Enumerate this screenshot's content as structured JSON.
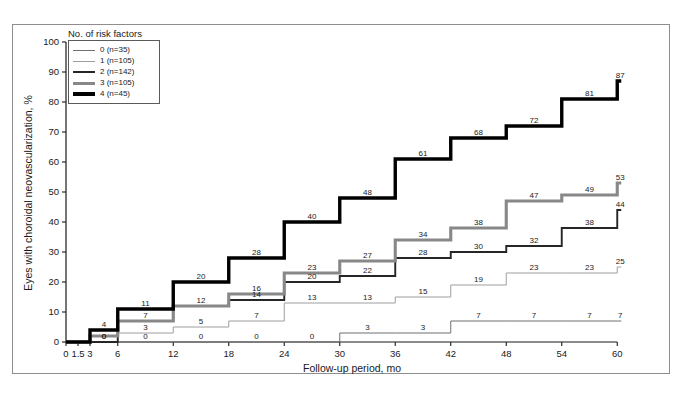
{
  "chart_data": {
    "type": "line",
    "subtype": "step",
    "title": "",
    "xlabel": "Follow-up period, mo",
    "ylabel": "Eyes with choroidal neovascularization, %",
    "xlim": [
      0,
      60
    ],
    "ylim": [
      0,
      100
    ],
    "xticks": [
      "0",
      "1.5",
      "3",
      "6",
      "12",
      "18",
      "24",
      "30",
      "36",
      "42",
      "48",
      "54",
      "60"
    ],
    "xtick_values": [
      0,
      1.5,
      3,
      6,
      12,
      18,
      24,
      30,
      36,
      42,
      48,
      54,
      60
    ],
    "yticks": [
      "0",
      "10",
      "20",
      "30",
      "40",
      "50",
      "60",
      "70",
      "80",
      "90",
      "100"
    ],
    "ytick_values": [
      0,
      10,
      20,
      30,
      40,
      50,
      60,
      70,
      80,
      90,
      100
    ],
    "grid": false,
    "legend_position": "top-left",
    "legend_title": "No. of risk factors",
    "series": [
      {
        "name": "0 (n=35)",
        "label": "0",
        "n": 35,
        "color": "#6f6f6f",
        "width": 1,
        "x": [
          0,
          1.5,
          3,
          6,
          12,
          18,
          24,
          30,
          36,
          42,
          48,
          54,
          60
        ],
        "values": [
          0,
          0,
          0,
          0,
          0,
          0,
          0,
          3,
          3,
          7,
          7,
          7,
          7
        ],
        "point_labels": [
          "",
          "",
          "0",
          "0",
          "0",
          "0",
          "0",
          "3",
          "3",
          "7",
          "7",
          "7",
          "7"
        ]
      },
      {
        "name": "1 (n=105)",
        "label": "1",
        "n": 105,
        "color": "#9e9e9e",
        "width": 1,
        "x": [
          0,
          1.5,
          3,
          6,
          12,
          18,
          24,
          30,
          36,
          42,
          48,
          54,
          60
        ],
        "values": [
          0,
          0,
          0,
          3,
          5,
          7,
          13,
          13,
          15,
          19,
          23,
          23,
          25
        ],
        "point_labels": [
          "",
          "",
          "",
          "3",
          "5",
          "7",
          "13",
          "13",
          "15",
          "19",
          "23",
          "23",
          "25"
        ]
      },
      {
        "name": "2 (n=142)",
        "label": "2",
        "n": 142,
        "color": "#262626",
        "width": 1.9,
        "x": [
          0,
          1.5,
          3,
          6,
          12,
          18,
          24,
          30,
          36,
          42,
          48,
          54,
          60
        ],
        "values": [
          0,
          0,
          0,
          7,
          12,
          14,
          20,
          22,
          28,
          30,
          32,
          38,
          44
        ],
        "point_labels": [
          "",
          "",
          "0",
          "7",
          "12",
          "14",
          "20",
          "22",
          "28",
          "30",
          "32",
          "38",
          "44"
        ]
      },
      {
        "name": "3 (n=105)",
        "label": "3",
        "n": 105,
        "color": "#888888",
        "width": 3.1,
        "x": [
          0,
          1.5,
          3,
          6,
          12,
          18,
          24,
          30,
          36,
          42,
          48,
          54,
          60
        ],
        "values": [
          0,
          0,
          2,
          7,
          12,
          16,
          23,
          27,
          34,
          38,
          47,
          49,
          53
        ],
        "point_labels": [
          "",
          "",
          "",
          "",
          "",
          "16",
          "23",
          "27",
          "34",
          "38",
          "47",
          "49",
          "53"
        ]
      },
      {
        "name": "4 (n=45)",
        "label": "4",
        "n": 45,
        "color": "#000000",
        "width": 3.4,
        "x": [
          0,
          1.5,
          3,
          6,
          12,
          18,
          24,
          30,
          36,
          42,
          48,
          54,
          60
        ],
        "values": [
          0,
          0,
          4,
          11,
          20,
          28,
          40,
          48,
          61,
          68,
          72,
          81,
          87
        ],
        "point_labels": [
          "",
          "",
          "4",
          "11",
          "20",
          "28",
          "40",
          "48",
          "61",
          "68",
          "72",
          "81",
          "87"
        ]
      }
    ]
  },
  "legend": {
    "title": "No. of risk factors",
    "entries": [
      {
        "label": "0 (n=35)",
        "color": "#6f6f6f",
        "width": 1
      },
      {
        "label": "1 (n=105)",
        "color": "#9e9e9e",
        "width": 1
      },
      {
        "label": "2 (n=142)",
        "color": "#262626",
        "width": 2
      },
      {
        "label": "3 (n=105)",
        "color": "#888888",
        "width": 3
      },
      {
        "label": "4 (n=45)",
        "color": "#000000",
        "width": 3.4
      }
    ]
  },
  "axes": {
    "x_title": "Follow-up period, mo",
    "y_title": "Eyes with choroidal neovascularization, %"
  }
}
